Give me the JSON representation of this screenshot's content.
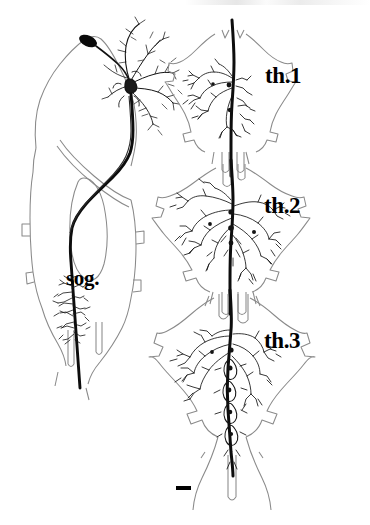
{
  "figure": {
    "type": "camera-lucida-neuroanatomy-drawing",
    "background_color": "#ffffff",
    "outline_color": "#808080",
    "neuron_color": "#000000",
    "width": 370,
    "height": 525
  },
  "labels": {
    "sog": "sog.",
    "th1": "th.1",
    "th2": "th.2",
    "th3": "th.3"
  },
  "panels": {
    "left": {
      "name": "brain-and-suboesophageal-ganglion",
      "label": "sog.",
      "features": [
        "soma",
        "brain-arborization",
        "descending-axon",
        "oesophageal-foramen",
        "suboesophageal-arborization"
      ]
    },
    "right": [
      {
        "name": "prothoracic-ganglion",
        "label": "th.1",
        "arborization": "compact-unilateral-tuft"
      },
      {
        "name": "mesothoracic-ganglion",
        "label": "th.2",
        "arborization": "broad-bilateral-branching"
      },
      {
        "name": "metathoracic-ganglion",
        "label": "th.3",
        "arborization": "extensive-midline-and-lateral-branching"
      }
    ]
  },
  "scale_bar": {
    "name": "scale-bar",
    "label": "",
    "x": 176,
    "y": 487,
    "length_px": 15,
    "thickness_px": 4,
    "color": "#000000"
  }
}
